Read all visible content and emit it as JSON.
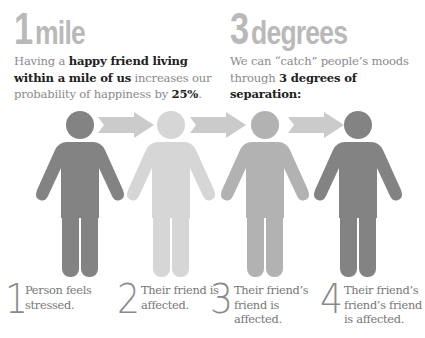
{
  "colors": {
    "headline_gray": "#b9b9b9",
    "figure_dark": "#838383",
    "figure_light": "#d6d6d6",
    "figure_medium": "#b2b2b2",
    "arrow": "#cbcbcb",
    "bold_text": "#222222",
    "body_text": "#8a8a8a"
  },
  "stat_left": {
    "number": "1",
    "unit": "mile",
    "text_pre": "Having a ",
    "text_bold1": "happy friend living within a mile of us",
    "text_mid": " increases our probability of happiness by ",
    "text_bold2": "25%",
    "text_post": "."
  },
  "stat_right": {
    "number": "3",
    "unit": "degrees",
    "text_pre": "We can “catch” people’s moods through ",
    "text_bold": "3 degrees of separation:"
  },
  "figures": [
    {
      "id": "person",
      "color": "#838383"
    },
    {
      "id": "friend",
      "color": "#d6d6d6"
    },
    {
      "id": "friends-friend",
      "color": "#b2b2b2"
    },
    {
      "id": "friends-friends-friend",
      "color": "#838383"
    }
  ],
  "arrows_count": 3,
  "steps": [
    {
      "number": "1",
      "text": "Person feels stressed."
    },
    {
      "number": "2",
      "text": "Their friend is affected."
    },
    {
      "number": "3",
      "text": "Their friend’s friend is affected."
    },
    {
      "number": "4",
      "text": "Their friend’s friend’s friend is affected."
    }
  ]
}
